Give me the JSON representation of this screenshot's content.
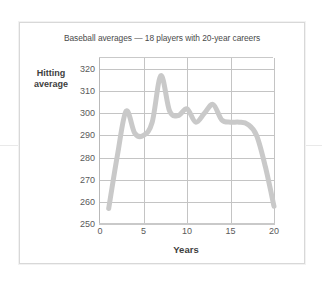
{
  "figure": {
    "title": "Baseball averages — 18 players with 20-year careers",
    "frame_color": "#d8d8d8",
    "background": "#ffffff"
  },
  "chart_data": {
    "type": "line",
    "title": "Baseball averages — 18 players with 20-year careers",
    "xlabel": "Years",
    "ylabel": "Hitting average",
    "ylabel_lines": [
      "Hitting",
      "average"
    ],
    "xlim": [
      0,
      20
    ],
    "ylim": [
      250,
      325
    ],
    "yticks": [
      250,
      260,
      270,
      280,
      290,
      300,
      310,
      320
    ],
    "ytick_labels": [
      "250",
      "260",
      "270",
      "280",
      "290",
      "300",
      "310",
      "320"
    ],
    "xticks": [
      0,
      5,
      10,
      15,
      20
    ],
    "xtick_labels": [
      "0",
      "5",
      "10",
      "15",
      "20"
    ],
    "grid": "horizontal-and-vertical",
    "legend": "none",
    "line_color": "#c9c9c9",
    "line_width": 5,
    "series": [
      {
        "name": "Hitting average",
        "x": [
          1,
          2,
          3,
          4,
          5,
          6,
          7,
          8,
          9,
          10,
          11,
          12,
          13,
          14,
          15,
          16,
          17,
          18,
          19,
          20
        ],
        "values": [
          257,
          281,
          301,
          291,
          290,
          296,
          317,
          301,
          299,
          302,
          296,
          300,
          304,
          297,
          296,
          296,
          295,
          290,
          276,
          258
        ]
      }
    ]
  }
}
